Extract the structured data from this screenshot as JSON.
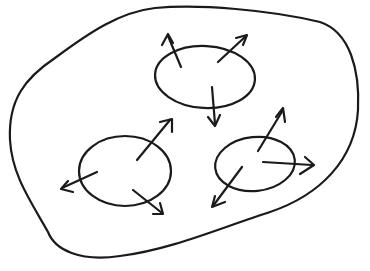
{
  "diagram": {
    "stroke_color": "#1a1a1a",
    "background_color": "#ffffff",
    "container": {
      "shape": "irregular-blob"
    },
    "regions": [
      {
        "id": "top",
        "cx": 205,
        "cy": 77,
        "rx": 50,
        "ry": 31,
        "arrow_count": 3
      },
      {
        "id": "bottom-left",
        "cx": 125,
        "cy": 171,
        "rx": 46,
        "ry": 35,
        "arrow_count": 3
      },
      {
        "id": "bottom-right",
        "cx": 255,
        "cy": 164,
        "rx": 40,
        "ry": 27,
        "arrow_count": 3
      }
    ]
  }
}
